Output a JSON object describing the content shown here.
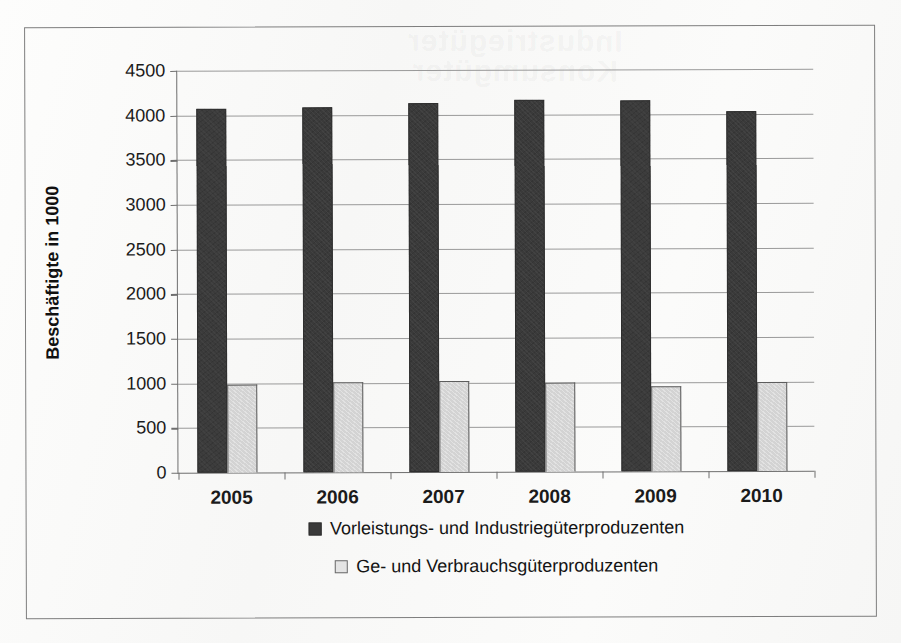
{
  "chart_data": {
    "type": "bar",
    "title": "",
    "xlabel": "",
    "ylabel": "Beschäftigte in 1000",
    "categories": [
      "2005",
      "2006",
      "2007",
      "2008",
      "2009",
      "2010"
    ],
    "series": [
      {
        "name": "Vorleistungs- und Industriegüterproduzenten",
        "color": "#3a3a3a",
        "swatch": "dark",
        "values": [
          4080,
          4085,
          4130,
          4160,
          4155,
          4030
        ]
      },
      {
        "name": "Ge- und Verbrauchsgüterproduzenten",
        "color": "#d3d3d3",
        "swatch": "light",
        "values": [
          980,
          1010,
          1015,
          995,
          955,
          1000
        ]
      }
    ],
    "ylim": [
      0,
      4500
    ],
    "yticks": [
      0,
      500,
      1000,
      1500,
      2000,
      2500,
      3000,
      3500,
      4000,
      4500
    ],
    "ytick_labels": [
      "0",
      "500",
      "1000",
      "1500",
      "2000",
      "2500",
      "3000",
      "3500",
      "4000",
      "4500"
    ],
    "grid": true,
    "grid_axis": "y",
    "legend_position": "bottom"
  },
  "figure": {
    "border_color": "#7e7e7e",
    "background": "#fbfbfa",
    "axis_color": "#6e6e6e",
    "gridline_color": "#9a9a9a",
    "text_color": "#1b1b1b"
  },
  "ghost_text": "Industriegüter\nKonsumgüter"
}
